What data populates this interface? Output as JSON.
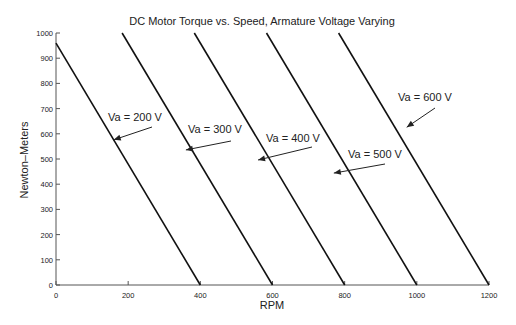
{
  "chart_data": {
    "type": "line",
    "title": "DC Motor Torque vs. Speed, Armature Voltage Varying",
    "xlabel": "RPM",
    "ylabel": "Newton–Meters",
    "xlim": [
      0,
      1200
    ],
    "ylim": [
      0,
      1000
    ],
    "xticks": [
      0,
      200,
      400,
      600,
      800,
      1000,
      1200
    ],
    "yticks": [
      0,
      100,
      200,
      300,
      400,
      500,
      600,
      700,
      800,
      900,
      1000
    ],
    "grid": false,
    "legend": "none (inline arrow annotations)",
    "series": [
      {
        "name": "Va = 200 V",
        "x": [
          0,
          400
        ],
        "y": [
          960,
          0
        ]
      },
      {
        "name": "Va = 300 V",
        "x": [
          183.3,
          600
        ],
        "y": [
          1000,
          0
        ]
      },
      {
        "name": "Va = 400 V",
        "x": [
          383.3,
          800
        ],
        "y": [
          1000,
          0
        ]
      },
      {
        "name": "Va = 500 V",
        "x": [
          583.3,
          1000
        ],
        "y": [
          1000,
          0
        ]
      },
      {
        "name": "Va = 600 V",
        "x": [
          783.3,
          1200
        ],
        "y": [
          1000,
          0
        ]
      }
    ],
    "annotations": [
      {
        "text": "Va = 200 V",
        "arrow_to": [
          160,
          576
        ]
      },
      {
        "text": "Va = 300 V",
        "arrow_to": [
          360,
          536
        ]
      },
      {
        "text": "Va = 400 V",
        "arrow_to": [
          560,
          496
        ]
      },
      {
        "text": "Va = 500 V",
        "arrow_to": [
          770,
          444
        ]
      },
      {
        "text": "Va = 600 V",
        "arrow_to": [
          972,
          626
        ]
      }
    ]
  }
}
